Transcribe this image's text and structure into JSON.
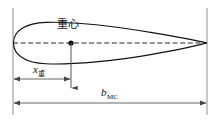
{
  "figure": {
    "background_color": "#ffffff",
    "line_color": "#111111",
    "reference_line_color": "#8a8a8a",
    "dimension_line_color": "#555555"
  },
  "labels": {
    "cg": "重心",
    "x_symbol": "x",
    "x_subscript": "重",
    "b_symbol": "b",
    "b_subscript": "MC"
  },
  "geometry": {
    "leading_edge_x": 13,
    "trailing_edge_x": 207,
    "chord_line_y": 43,
    "airfoil_top_y": 23,
    "airfoil_bottom_y": 63,
    "cg_point_x": 71,
    "cg_point_y": 43,
    "cg_arrow_bottom_y": 93,
    "dim_x_cg_y": 79,
    "dim_b_mc_y": 103,
    "ref_line_top_y": 8,
    "ref_line_bottom_y": 115
  }
}
